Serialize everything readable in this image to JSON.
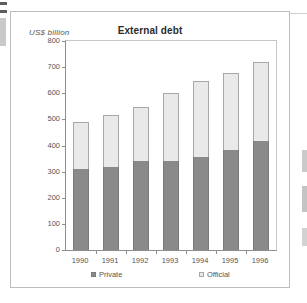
{
  "chart_data": {
    "type": "bar",
    "subtype": "stacked-column",
    "title": "External debt",
    "ylabel": "US$ billion",
    "xlabel": "",
    "categories": [
      "1990",
      "1991",
      "1992",
      "1993",
      "1994",
      "1995",
      "1996"
    ],
    "series": [
      {
        "name": "Private",
        "color": "#8a8a8a",
        "values": [
          312,
          317,
          340,
          340,
          357,
          382,
          417
        ]
      },
      {
        "name": "Official",
        "color": "#e9e9e9",
        "values": [
          178,
          201,
          209,
          260,
          291,
          296,
          303
        ]
      }
    ],
    "totals": [
      490,
      518,
      549,
      600,
      648,
      678,
      720
    ],
    "ylim": [
      0,
      800
    ],
    "ytick_step": 100,
    "yticks": [
      "800",
      "700",
      "600",
      "500",
      "400",
      "300",
      "200",
      "100",
      "0"
    ],
    "grid": false,
    "legend_position": "bottom"
  },
  "legend": {
    "private_label": "Private",
    "official_label": "Official"
  }
}
